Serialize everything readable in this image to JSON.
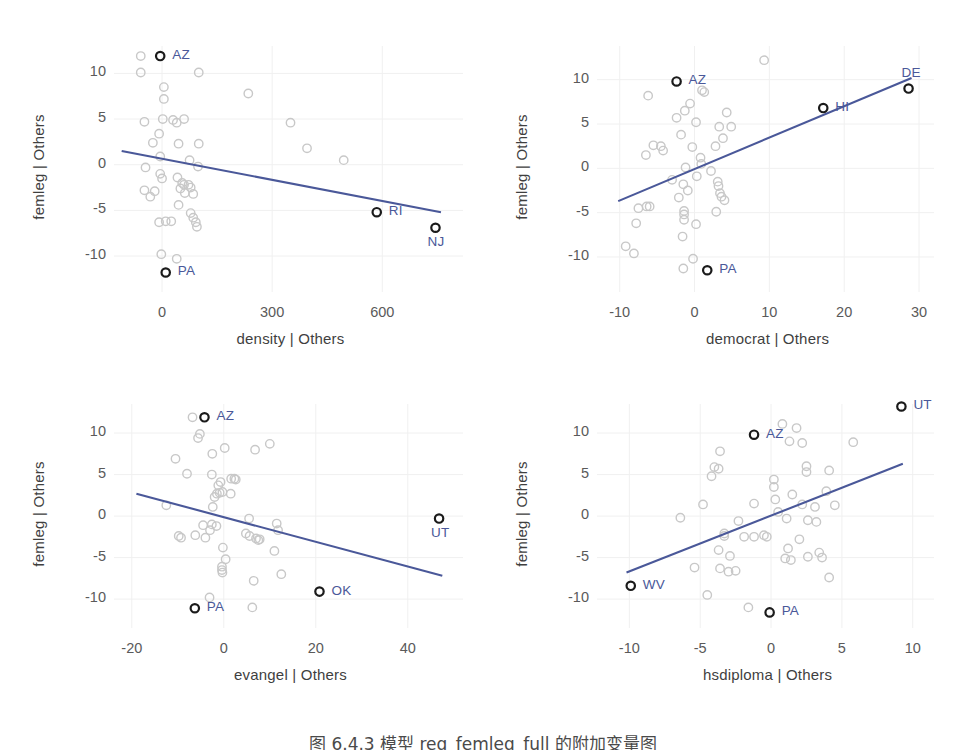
{
  "figure": {
    "caption": "图 6.4.3  模型 reg_femleg_full 的附加变量图",
    "line_color": "#4a5899",
    "marker_color": "#c8c8c8",
    "highlight_color": "#1a1a1a",
    "label_color": "#4a5899",
    "grid_color": "#f0f0f0",
    "background": "#ffffff"
  },
  "chart_data": [
    {
      "type": "scatter",
      "panel": "top-left",
      "title": "",
      "xlabel": "density  | Others",
      "ylabel": "femleg  | Others",
      "xlim": [
        -120,
        820
      ],
      "ylim": [
        -13.5,
        13.0
      ],
      "xticks": [
        0,
        300,
        600
      ],
      "xticklabels": [
        "0",
        "300",
        "600"
      ],
      "yticks": [
        -10,
        -5,
        0,
        5,
        10
      ],
      "yticklabels": [
        "-10",
        "-5",
        "0",
        "5",
        "10"
      ],
      "grid": true,
      "legend": "none",
      "fit_line": {
        "x": [
          -110,
          760
        ],
        "y": [
          1.5,
          -5.2
        ]
      },
      "points": [
        {
          "x": -58,
          "y": 11.9
        },
        {
          "x": -58,
          "y": 10.1
        },
        {
          "x": 5,
          "y": 8.5
        },
        {
          "x": 5,
          "y": 7.2
        },
        {
          "x": 100,
          "y": 10.1
        },
        {
          "x": 235,
          "y": 7.8
        },
        {
          "x": -48,
          "y": 4.7
        },
        {
          "x": 2,
          "y": 5.0
        },
        {
          "x": 30,
          "y": 4.9
        },
        {
          "x": 40,
          "y": 4.6
        },
        {
          "x": 60,
          "y": 5.0
        },
        {
          "x": 350,
          "y": 4.6
        },
        {
          "x": -8,
          "y": 3.4
        },
        {
          "x": -25,
          "y": 2.4
        },
        {
          "x": 45,
          "y": 2.3
        },
        {
          "x": 100,
          "y": 2.3
        },
        {
          "x": 395,
          "y": 1.8
        },
        {
          "x": -5,
          "y": 0.9
        },
        {
          "x": 75,
          "y": 0.5
        },
        {
          "x": 495,
          "y": 0.5
        },
        {
          "x": -45,
          "y": -0.3
        },
        {
          "x": 98,
          "y": -0.2
        },
        {
          "x": -5,
          "y": -1.0
        },
        {
          "x": 0,
          "y": -1.5
        },
        {
          "x": 42,
          "y": -1.4
        },
        {
          "x": 55,
          "y": -2.0
        },
        {
          "x": 60,
          "y": -2.2
        },
        {
          "x": 72,
          "y": -2.2
        },
        {
          "x": 50,
          "y": -2.6
        },
        {
          "x": 78,
          "y": -2.5
        },
        {
          "x": -48,
          "y": -2.8
        },
        {
          "x": -20,
          "y": -2.9
        },
        {
          "x": -32,
          "y": -3.5
        },
        {
          "x": 62,
          "y": -3.1
        },
        {
          "x": 85,
          "y": -3.2
        },
        {
          "x": 45,
          "y": -4.4
        },
        {
          "x": 78,
          "y": -5.3
        },
        {
          "x": 85,
          "y": -5.8
        },
        {
          "x": -8,
          "y": -6.3
        },
        {
          "x": 10,
          "y": -6.2
        },
        {
          "x": 25,
          "y": -6.2
        },
        {
          "x": 92,
          "y": -6.3
        },
        {
          "x": 95,
          "y": -6.8
        },
        {
          "x": -2,
          "y": -9.8
        },
        {
          "x": 40,
          "y": -10.3
        }
      ],
      "highlighted": [
        {
          "label": "AZ",
          "x": -5,
          "y": 11.9,
          "pos": "right"
        },
        {
          "label": "RI",
          "x": 585,
          "y": -5.2,
          "pos": "right"
        },
        {
          "label": "NJ",
          "x": 745,
          "y": -6.9,
          "pos": "below"
        },
        {
          "label": "PA",
          "x": 10,
          "y": -11.8,
          "pos": "right"
        }
      ]
    },
    {
      "type": "scatter",
      "panel": "top-right",
      "title": "",
      "xlabel": "democrat  | Others",
      "ylabel": "femleg  | Others",
      "xlim": [
        -12.5,
        32.0
      ],
      "ylim": [
        -13.5,
        13.8
      ],
      "xticks": [
        -10,
        0,
        10,
        20,
        30
      ],
      "xticklabels": [
        "-10",
        "0",
        "10",
        "20",
        "30"
      ],
      "yticks": [
        -10,
        -5,
        0,
        5,
        10
      ],
      "yticklabels": [
        "-10",
        "-5",
        "0",
        "5",
        "10"
      ],
      "grid": true,
      "legend": "none",
      "fit_line": {
        "x": [
          -10.2,
          29.0
        ],
        "y": [
          -3.7,
          10.2
        ]
      },
      "points": [
        {
          "x": 9.3,
          "y": 12.2
        },
        {
          "x": -6.2,
          "y": 8.2
        },
        {
          "x": 1.0,
          "y": 8.8
        },
        {
          "x": 1.3,
          "y": 8.6
        },
        {
          "x": -0.6,
          "y": 7.3
        },
        {
          "x": -1.3,
          "y": 6.5
        },
        {
          "x": -2.4,
          "y": 5.7
        },
        {
          "x": 4.3,
          "y": 6.3
        },
        {
          "x": 0.2,
          "y": 5.2
        },
        {
          "x": 3.3,
          "y": 4.7
        },
        {
          "x": 4.9,
          "y": 4.7
        },
        {
          "x": -1.8,
          "y": 3.8
        },
        {
          "x": 3.8,
          "y": 3.4
        },
        {
          "x": -5.5,
          "y": 2.6
        },
        {
          "x": -4.5,
          "y": 2.5
        },
        {
          "x": -0.3,
          "y": 2.4
        },
        {
          "x": 2.8,
          "y": 2.5
        },
        {
          "x": -4.2,
          "y": 2.0
        },
        {
          "x": -6.5,
          "y": 1.5
        },
        {
          "x": 0.8,
          "y": 1.2
        },
        {
          "x": -1.2,
          "y": 0.1
        },
        {
          "x": 0.9,
          "y": 0.5
        },
        {
          "x": 2.2,
          "y": -0.3
        },
        {
          "x": 0.3,
          "y": -0.9
        },
        {
          "x": -3.0,
          "y": -1.3
        },
        {
          "x": -1.5,
          "y": -1.8
        },
        {
          "x": 3.1,
          "y": -1.5
        },
        {
          "x": 3.2,
          "y": -2.0
        },
        {
          "x": -0.9,
          "y": -2.5
        },
        {
          "x": 3.4,
          "y": -2.8
        },
        {
          "x": 3.6,
          "y": -3.2
        },
        {
          "x": -2.1,
          "y": -3.3
        },
        {
          "x": 4.0,
          "y": -3.6
        },
        {
          "x": -7.5,
          "y": -4.5
        },
        {
          "x": -6.4,
          "y": -4.3
        },
        {
          "x": -6.0,
          "y": -4.3
        },
        {
          "x": -1.4,
          "y": -4.8
        },
        {
          "x": -1.4,
          "y": -5.2
        },
        {
          "x": 2.9,
          "y": -4.9
        },
        {
          "x": -7.8,
          "y": -6.2
        },
        {
          "x": -1.4,
          "y": -5.8
        },
        {
          "x": 0.2,
          "y": -6.3
        },
        {
          "x": -1.6,
          "y": -7.7
        },
        {
          "x": -9.2,
          "y": -8.8
        },
        {
          "x": -8.1,
          "y": -9.6
        },
        {
          "x": -0.2,
          "y": -10.2
        },
        {
          "x": -1.5,
          "y": -11.3
        }
      ],
      "highlighted": [
        {
          "label": "AZ",
          "x": -2.4,
          "y": 9.8,
          "pos": "right"
        },
        {
          "label": "DE",
          "x": 28.6,
          "y": 9.0,
          "pos": "above"
        },
        {
          "label": "HI",
          "x": 17.2,
          "y": 6.8,
          "pos": "right"
        },
        {
          "label": "PA",
          "x": 1.7,
          "y": -11.5,
          "pos": "right"
        }
      ]
    },
    {
      "type": "scatter",
      "panel": "bottom-left",
      "title": "",
      "xlabel": "evangel  | Others",
      "ylabel": "femleg  | Others",
      "xlim": [
        -23,
        52
      ],
      "ylim": [
        -13.0,
        13.5
      ],
      "xticks": [
        -20,
        0,
        20,
        40
      ],
      "xticklabels": [
        "-20",
        "0",
        "20",
        "40"
      ],
      "yticks": [
        -10,
        -5,
        0,
        5,
        10
      ],
      "yticklabels": [
        "-10",
        "-5",
        "0",
        "5",
        "10"
      ],
      "grid": true,
      "legend": "none",
      "fit_line": {
        "x": [
          -19.0,
          47.5
        ],
        "y": [
          2.7,
          -7.2
        ]
      },
      "points": [
        {
          "x": -6.8,
          "y": 11.9
        },
        {
          "x": -5.2,
          "y": 9.9
        },
        {
          "x": -5.6,
          "y": 9.4
        },
        {
          "x": 0.2,
          "y": 8.2
        },
        {
          "x": 6.8,
          "y": 8.0
        },
        {
          "x": 10.0,
          "y": 8.7
        },
        {
          "x": -2.5,
          "y": 7.5
        },
        {
          "x": -10.5,
          "y": 6.9
        },
        {
          "x": -8.0,
          "y": 5.1
        },
        {
          "x": -2.6,
          "y": 5.0
        },
        {
          "x": -0.7,
          "y": 4.1
        },
        {
          "x": 1.6,
          "y": 4.5
        },
        {
          "x": 2.3,
          "y": 4.5
        },
        {
          "x": 2.6,
          "y": 4.4
        },
        {
          "x": -1.2,
          "y": 3.7
        },
        {
          "x": -1.5,
          "y": 2.7
        },
        {
          "x": -0.9,
          "y": 2.8
        },
        {
          "x": -0.3,
          "y": 2.9
        },
        {
          "x": 1.5,
          "y": 2.7
        },
        {
          "x": -2.0,
          "y": 2.3
        },
        {
          "x": -2.4,
          "y": 1.1
        },
        {
          "x": -12.5,
          "y": 1.3
        },
        {
          "x": 5.5,
          "y": -0.3
        },
        {
          "x": 11.5,
          "y": -0.9
        },
        {
          "x": -4.5,
          "y": -1.1
        },
        {
          "x": -2.6,
          "y": -1.0
        },
        {
          "x": -1.6,
          "y": -1.2
        },
        {
          "x": -3.0,
          "y": -1.7
        },
        {
          "x": 11.8,
          "y": -1.7
        },
        {
          "x": -6.2,
          "y": -2.3
        },
        {
          "x": -9.8,
          "y": -2.4
        },
        {
          "x": -9.3,
          "y": -2.6
        },
        {
          "x": -4.0,
          "y": -2.6
        },
        {
          "x": 4.8,
          "y": -2.1
        },
        {
          "x": 5.6,
          "y": -2.4
        },
        {
          "x": 7.0,
          "y": -2.7
        },
        {
          "x": 7.5,
          "y": -2.9
        },
        {
          "x": 7.8,
          "y": -2.8
        },
        {
          "x": -0.2,
          "y": -3.8
        },
        {
          "x": 11.0,
          "y": -4.2
        },
        {
          "x": 0.4,
          "y": -5.2
        },
        {
          "x": -0.4,
          "y": -6.1
        },
        {
          "x": -0.4,
          "y": -6.5
        },
        {
          "x": -0.3,
          "y": -6.8
        },
        {
          "x": 12.5,
          "y": -7.0
        },
        {
          "x": 6.5,
          "y": -7.8
        },
        {
          "x": -3.1,
          "y": -9.8
        },
        {
          "x": 6.2,
          "y": -11.0
        }
      ],
      "highlighted": [
        {
          "label": "AZ",
          "x": -4.2,
          "y": 11.9,
          "pos": "right"
        },
        {
          "label": "UT",
          "x": 46.8,
          "y": -0.3,
          "pos": "below"
        },
        {
          "label": "OK",
          "x": 20.8,
          "y": -9.1,
          "pos": "right"
        },
        {
          "label": "PA",
          "x": -6.3,
          "y": -11.1,
          "pos": "right"
        }
      ]
    },
    {
      "type": "scatter",
      "panel": "bottom-right",
      "title": "",
      "xlabel": "hsdiploma  | Others",
      "ylabel": "femleg  | Others",
      "xlim": [
        -12.0,
        11.5
      ],
      "ylim": [
        -13.0,
        13.5
      ],
      "xticks": [
        -10,
        -5,
        0,
        5,
        10
      ],
      "xticklabels": [
        "-10",
        "-5",
        "0",
        "5",
        "10"
      ],
      "yticks": [
        -10,
        -5,
        0,
        5,
        10
      ],
      "yticklabels": [
        "-10",
        "-5",
        "0",
        "5",
        "10"
      ],
      "grid": true,
      "legend": "none",
      "fit_line": {
        "x": [
          -10.2,
          9.3
        ],
        "y": [
          -6.8,
          6.3
        ]
      },
      "points": [
        {
          "x": 0.8,
          "y": 11.1
        },
        {
          "x": 1.8,
          "y": 10.6
        },
        {
          "x": 1.3,
          "y": 9.0
        },
        {
          "x": 2.2,
          "y": 8.8
        },
        {
          "x": 5.8,
          "y": 8.9
        },
        {
          "x": -3.6,
          "y": 7.8
        },
        {
          "x": -4.0,
          "y": 5.9
        },
        {
          "x": -3.7,
          "y": 5.7
        },
        {
          "x": 2.5,
          "y": 6.0
        },
        {
          "x": 2.5,
          "y": 5.3
        },
        {
          "x": -4.2,
          "y": 4.8
        },
        {
          "x": 0.2,
          "y": 4.4
        },
        {
          "x": 4.1,
          "y": 5.5
        },
        {
          "x": 0.2,
          "y": 3.5
        },
        {
          "x": 1.5,
          "y": 2.6
        },
        {
          "x": 3.9,
          "y": 3.0
        },
        {
          "x": 0.3,
          "y": 2.0
        },
        {
          "x": -1.2,
          "y": 1.5
        },
        {
          "x": -4.8,
          "y": 1.4
        },
        {
          "x": 2.2,
          "y": 1.4
        },
        {
          "x": 3.1,
          "y": 1.1
        },
        {
          "x": 4.5,
          "y": 1.3
        },
        {
          "x": 0.5,
          "y": 0.5
        },
        {
          "x": -6.4,
          "y": -0.2
        },
        {
          "x": -2.3,
          "y": -0.6
        },
        {
          "x": 1.1,
          "y": -0.3
        },
        {
          "x": 2.6,
          "y": -0.5
        },
        {
          "x": 3.2,
          "y": -0.7
        },
        {
          "x": -3.3,
          "y": -2.1
        },
        {
          "x": -3.3,
          "y": -2.4
        },
        {
          "x": -1.9,
          "y": -2.5
        },
        {
          "x": -1.2,
          "y": -2.5
        },
        {
          "x": -0.5,
          "y": -2.3
        },
        {
          "x": -0.3,
          "y": -2.5
        },
        {
          "x": 2.0,
          "y": -2.8
        },
        {
          "x": -3.7,
          "y": -4.1
        },
        {
          "x": 1.2,
          "y": -3.9
        },
        {
          "x": -2.9,
          "y": -4.8
        },
        {
          "x": 1.0,
          "y": -5.1
        },
        {
          "x": 1.4,
          "y": -5.3
        },
        {
          "x": 2.6,
          "y": -4.9
        },
        {
          "x": 3.4,
          "y": -4.4
        },
        {
          "x": 3.6,
          "y": -5.0
        },
        {
          "x": -5.4,
          "y": -6.2
        },
        {
          "x": -3.6,
          "y": -6.3
        },
        {
          "x": -3.0,
          "y": -6.7
        },
        {
          "x": -2.5,
          "y": -6.6
        },
        {
          "x": 4.1,
          "y": -7.4
        },
        {
          "x": -4.5,
          "y": -9.5
        },
        {
          "x": -1.6,
          "y": -11.0
        }
      ],
      "highlighted": [
        {
          "label": "UT",
          "x": 9.2,
          "y": 13.2,
          "pos": "right"
        },
        {
          "label": "AZ",
          "x": -1.2,
          "y": 9.8,
          "pos": "right"
        },
        {
          "label": "WV",
          "x": -9.9,
          "y": -8.4,
          "pos": "right"
        },
        {
          "label": "PA",
          "x": -0.1,
          "y": -11.6,
          "pos": "right"
        }
      ]
    }
  ]
}
